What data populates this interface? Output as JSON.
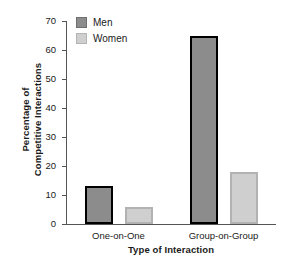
{
  "chart_data": {
    "type": "bar",
    "title": "",
    "subtitle": "",
    "xlabel": "Type of Interaction",
    "ylabel": "Percentage of\nCompetitive Interactions",
    "categories": [
      "One-on-One",
      "Group-on-Group"
    ],
    "series": [
      {
        "name": "Men",
        "values": [
          13,
          65
        ],
        "color": "#8c8c8c",
        "edge_color": "#000000"
      },
      {
        "name": "Women",
        "values": [
          6,
          18
        ],
        "color": "#cfcfcf",
        "edge_color": "#b2b2b2"
      }
    ],
    "ylim": [
      0,
      70
    ],
    "yticks": [
      0,
      10,
      20,
      30,
      40,
      50,
      60,
      70
    ],
    "ytick_labels": [
      "0",
      "10",
      "20",
      "30",
      "40",
      "50",
      "60",
      "70"
    ],
    "grid": false,
    "legend_position": "upper-left-inside",
    "legend_entries": [
      "Men",
      "Women"
    ]
  }
}
